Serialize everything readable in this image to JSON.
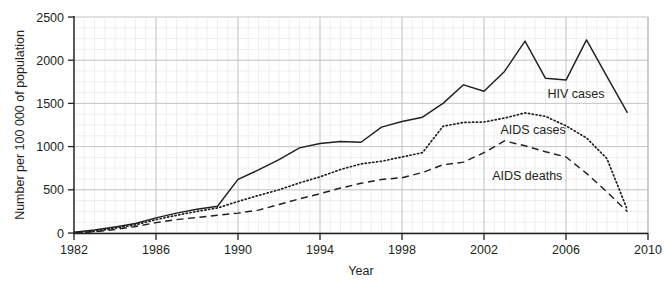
{
  "chart_data": {
    "type": "line",
    "title": "",
    "xlabel": "Year",
    "ylabel": "Number per 100 000 of population",
    "xlim": [
      1982,
      2010
    ],
    "ylim": [
      0,
      2500
    ],
    "xticks": [
      "1982",
      "1986",
      "1990",
      "1994",
      "1998",
      "2002",
      "2006",
      "2010"
    ],
    "yticks": [
      "0",
      "500",
      "1000",
      "1500",
      "2000",
      "2500"
    ],
    "grid": "major and minor gridlines, light grey",
    "legend_position": "inline labels beside each curve",
    "x": [
      1982,
      1983,
      1984,
      1985,
      1986,
      1987,
      1988,
      1989,
      1990,
      1991,
      1992,
      1993,
      1994,
      1995,
      1996,
      1997,
      1998,
      1999,
      2000,
      2001,
      2002,
      2003,
      2004,
      2005,
      2006,
      2007,
      2008,
      2009
    ],
    "series": [
      {
        "name": "HIV cases",
        "style": "solid",
        "color": "#231f20",
        "values": [
          10,
          35,
          70,
          110,
          175,
          230,
          275,
          310,
          620,
          730,
          850,
          985,
          1035,
          1060,
          1050,
          1225,
          1290,
          1340,
          1500,
          1715,
          1640,
          1870,
          2220,
          1790,
          1770,
          2235,
          1810,
          1390
        ]
      },
      {
        "name": "AIDS cases",
        "style": "dotted",
        "color": "#231f20",
        "values": [
          5,
          20,
          55,
          95,
          155,
          205,
          250,
          290,
          365,
          435,
          500,
          580,
          650,
          735,
          800,
          830,
          880,
          930,
          1235,
          1280,
          1285,
          1330,
          1390,
          1350,
          1240,
          1100,
          860,
          265
        ]
      },
      {
        "name": "AIDS deaths",
        "style": "dashed",
        "color": "#231f20",
        "values": [
          3,
          15,
          40,
          75,
          120,
          155,
          180,
          205,
          230,
          265,
          330,
          395,
          455,
          520,
          575,
          620,
          640,
          700,
          790,
          820,
          930,
          1065,
          1010,
          940,
          880,
          690,
          475,
          245
        ]
      }
    ],
    "annotations": [
      {
        "name": "hiv-cases-label",
        "text": "HIV cases",
        "x": 2005.1,
        "y": 1560
      },
      {
        "name": "aids-cases-label",
        "text": "AIDS cases",
        "x": 2002.8,
        "y": 1150
      },
      {
        "name": "aids-deaths-label",
        "text": "AIDS deaths",
        "x": 2002.4,
        "y": 610
      }
    ]
  }
}
